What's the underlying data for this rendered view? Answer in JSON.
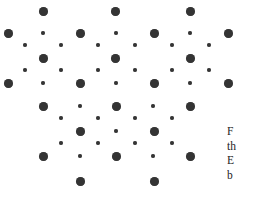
{
  "figure": {
    "name": "hexagonal-dot-lattice",
    "background_color": "#ffffff",
    "dot_color": "#343434",
    "large_dot_diameter": 9,
    "small_dot_diameter": 4,
    "width": 256,
    "height": 198
  },
  "chart_data": {
    "type": "scatter",
    "title": "",
    "xlabel": "",
    "ylabel": "",
    "xlim": [
      0,
      256
    ],
    "ylim": [
      0,
      198
    ],
    "grid": false,
    "legend": "none",
    "series": [
      {
        "name": "large-dots",
        "marker": "filled-circle",
        "size": 9,
        "color": "#343434",
        "points": [
          [
            43,
            11
          ],
          [
            115,
            11
          ],
          [
            190,
            11
          ],
          [
            8,
            33
          ],
          [
            80,
            33
          ],
          [
            154,
            33
          ],
          [
            228,
            33
          ],
          [
            43,
            58
          ],
          [
            115,
            58
          ],
          [
            190,
            58
          ],
          [
            8,
            83
          ],
          [
            80,
            83
          ],
          [
            154,
            83
          ],
          [
            228,
            83
          ],
          [
            43,
            106
          ],
          [
            116,
            106
          ],
          [
            190,
            106
          ],
          [
            80,
            131
          ],
          [
            154,
            131
          ],
          [
            43,
            156
          ],
          [
            116,
            156
          ],
          [
            190,
            156
          ],
          [
            80,
            181
          ],
          [
            154,
            181
          ]
        ]
      },
      {
        "name": "small-dots",
        "marker": "filled-circle",
        "size": 4,
        "color": "#343434",
        "points": [
          [
            43,
            33
          ],
          [
            116,
            33
          ],
          [
            190,
            33
          ],
          [
            25,
            45
          ],
          [
            61,
            45
          ],
          [
            98,
            45
          ],
          [
            135,
            45
          ],
          [
            172,
            45
          ],
          [
            209,
            45
          ],
          [
            25,
            70
          ],
          [
            61,
            70
          ],
          [
            98,
            70
          ],
          [
            135,
            70
          ],
          [
            172,
            70
          ],
          [
            209,
            70
          ],
          [
            43,
            83
          ],
          [
            116,
            83
          ],
          [
            190,
            83
          ],
          [
            80,
            106
          ],
          [
            153,
            106
          ],
          [
            61,
            118
          ],
          [
            98,
            118
          ],
          [
            135,
            118
          ],
          [
            172,
            118
          ],
          [
            116,
            131
          ],
          [
            61,
            143
          ],
          [
            98,
            143
          ],
          [
            135,
            143
          ],
          [
            172,
            143
          ],
          [
            80,
            156
          ],
          [
            153,
            156
          ]
        ]
      }
    ]
  },
  "caption": {
    "name": "figure-caption",
    "truncated": true,
    "lines": [
      "F",
      "th",
      "E",
      "b"
    ]
  }
}
